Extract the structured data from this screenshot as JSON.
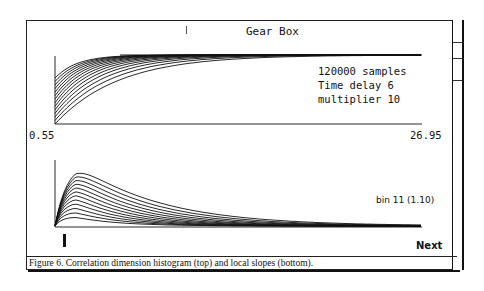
{
  "window": {
    "title": "Gear Box"
  },
  "top_panel": {
    "info_lines": [
      "120000 samples",
      "Time delay 6",
      "multiplier 10"
    ],
    "x_min_label": "0.55",
    "x_max_label": "26.95"
  },
  "bottom_panel": {
    "bin_label": "bin 11 (1.10)",
    "next_button": "Next"
  },
  "caption": "Figure 6. Correlation dimension histogram (top) and local slopes (bottom).",
  "chart_data": [
    {
      "type": "line",
      "title": "Correlation dimension histogram",
      "xlabel": "",
      "ylabel": "",
      "x_range": [
        0.55,
        26.95
      ],
      "series_count": 14,
      "description": "Family of saturating curves rising from the lower-left and converging to a common plateau toward the right",
      "annotations": [
        "120000 samples",
        "Time delay 6",
        "multiplier 10"
      ]
    },
    {
      "type": "line",
      "title": "Local slopes",
      "xlabel": "",
      "ylabel": "",
      "series_count": 12,
      "description": "Family of curves peaking near the left edge and decaying toward zero on the right",
      "annotations": [
        "bin 11 (1.10)"
      ]
    }
  ]
}
